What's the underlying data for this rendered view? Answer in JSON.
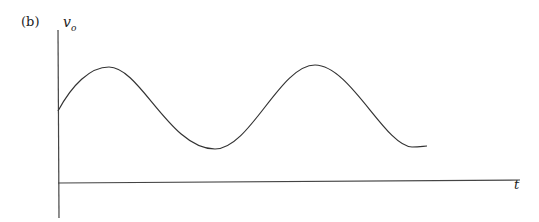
{
  "panel_label": "(b)",
  "y_axis": {
    "symbol": "v",
    "subscript": "o"
  },
  "x_axis": {
    "symbol": "t"
  },
  "waveform": {
    "type": "sinusoid_with_dc_offset",
    "start": [
      58,
      111
    ],
    "peaks": [
      [
        109,
        67
      ],
      [
        315,
        65
      ]
    ],
    "troughs": [
      [
        215,
        149
      ]
    ],
    "end": [
      427,
      146
    ]
  },
  "colors": {
    "line": "#333333",
    "background": "#ffffff"
  }
}
